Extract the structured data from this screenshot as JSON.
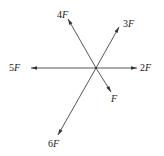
{
  "diagram": {
    "type": "concurrent force vectors",
    "center": {
      "x": 96,
      "y": 68
    },
    "colors": {
      "line": "#444444",
      "text": "#222222",
      "background": "#ffffff"
    },
    "forces": [
      {
        "id": "f4",
        "coef": "4",
        "unit": "F",
        "tail": {
          "x": 96,
          "y": 68
        },
        "tip": {
          "x": 68,
          "y": 19
        },
        "label_pos": {
          "x": 57,
          "y": 18
        }
      },
      {
        "id": "f3",
        "coef": "3",
        "unit": "F",
        "tail": {
          "x": 96,
          "y": 68
        },
        "tip": {
          "x": 119,
          "y": 27
        },
        "label_pos": {
          "x": 123,
          "y": 27
        }
      },
      {
        "id": "f5",
        "coef": "5",
        "unit": "F",
        "tail": {
          "x": 96,
          "y": 68
        },
        "tip": {
          "x": 31,
          "y": 68
        },
        "label_pos": {
          "x": 9,
          "y": 71
        }
      },
      {
        "id": "f2",
        "coef": "2",
        "unit": "F",
        "tail": {
          "x": 96,
          "y": 68
        },
        "tip": {
          "x": 137,
          "y": 68
        },
        "label_pos": {
          "x": 140,
          "y": 71
        }
      },
      {
        "id": "f1",
        "coef": "",
        "unit": "F",
        "tail": {
          "x": 96,
          "y": 68
        },
        "tip": {
          "x": 111,
          "y": 92
        },
        "label_pos": {
          "x": 111,
          "y": 102
        }
      },
      {
        "id": "f6",
        "coef": "6",
        "unit": "F",
        "tail": {
          "x": 96,
          "y": 68
        },
        "tip": {
          "x": 58,
          "y": 135
        },
        "label_pos": {
          "x": 48,
          "y": 147
        }
      }
    ]
  }
}
